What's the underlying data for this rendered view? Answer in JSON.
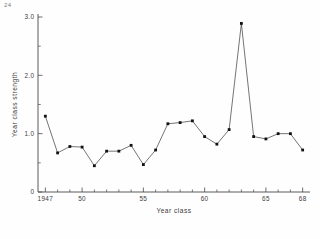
{
  "page": {
    "corner_mark": "24"
  },
  "chart_data": {
    "type": "line",
    "title": "",
    "xlabel": "Year class",
    "ylabel": "Year class strength",
    "x": [
      1947,
      1948,
      1949,
      1950,
      1951,
      1952,
      1953,
      1954,
      1955,
      1956,
      1957,
      1958,
      1959,
      1960,
      1961,
      1962,
      1963,
      1964,
      1965,
      1966,
      1967,
      1968
    ],
    "values": [
      1.3,
      0.67,
      0.78,
      0.77,
      0.45,
      0.7,
      0.7,
      0.8,
      0.47,
      0.72,
      1.17,
      1.19,
      1.22,
      0.95,
      0.82,
      1.07,
      2.89,
      0.95,
      0.91,
      1.0,
      1.0,
      0.72
    ],
    "categories": [
      "1947",
      "1948",
      "1949",
      "1950",
      "1951",
      "1952",
      "1953",
      "1954",
      "1955",
      "1956",
      "1957",
      "1958",
      "1959",
      "1960",
      "1961",
      "1962",
      "1963",
      "1964",
      "1965",
      "1966",
      "1967",
      "1968"
    ],
    "xlim": [
      1946.4,
      1968.6
    ],
    "ylim": [
      0,
      3.0
    ],
    "xticks": [
      1947,
      1950,
      1955,
      1960,
      1965,
      1968
    ],
    "xticklabels": [
      "1947",
      "50",
      "55",
      "60",
      "65",
      "68"
    ],
    "yticks": [
      0,
      1.0,
      2.0,
      3.0
    ],
    "yticklabels": [
      "0",
      "1.0",
      "2.0",
      "3.0"
    ],
    "yticks_minor": [
      0.5,
      1.5,
      2.5
    ],
    "grid": false,
    "legend": null,
    "marker": "filled-square",
    "line_color": "#3a3a3a",
    "marker_color": "#111111",
    "axis_color": "#4a4a4a"
  }
}
